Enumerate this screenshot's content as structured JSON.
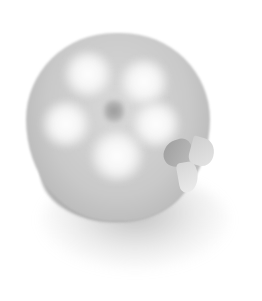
{
  "image": {
    "subject": "five-lobed flower-shaped object with leaf",
    "style": "grayscale",
    "colors": {
      "background": "#ffffff",
      "body": "#c9c9c9",
      "highlight": "#ffffff",
      "shadow": "#a8a8a8",
      "leaf_dark": "#9d9d9d",
      "leaf_light": "#e4e4e4"
    }
  }
}
